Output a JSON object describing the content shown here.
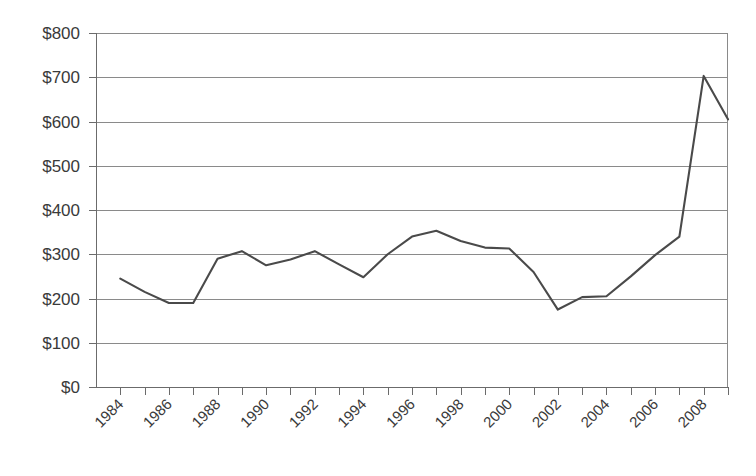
{
  "chart_data": {
    "type": "line",
    "title": "",
    "subtitle": "",
    "xlabel": "",
    "ylabel": "",
    "grid": true,
    "legend": false,
    "legend_position": "none",
    "line_color": "#4a4a4a",
    "axis_color": "#6b6b6b",
    "grid_color": "#8a8a8a",
    "background_color": "#ffffff",
    "ylim": [
      0,
      800
    ],
    "ytick_step": 100,
    "ytick_labels": [
      "$0",
      "$100",
      "$200",
      "$300",
      "$400",
      "$500",
      "$600",
      "$700",
      "$800"
    ],
    "ytick_values": [
      0,
      100,
      200,
      300,
      400,
      500,
      600,
      700,
      800
    ],
    "xlim": [
      1983,
      2009
    ],
    "xtick_label_step": 2,
    "xtick_labels": [
      "1984",
      "1986",
      "1988",
      "1990",
      "1992",
      "1994",
      "1996",
      "1998",
      "2000",
      "2002",
      "2004",
      "2006",
      "2008"
    ],
    "xtick_label_values": [
      1984,
      1986,
      1988,
      1990,
      1992,
      1994,
      1996,
      1998,
      2000,
      2002,
      2004,
      2006,
      2008
    ],
    "xtick_label_rotation": -45,
    "x": [
      1984,
      1985,
      1986,
      1987,
      1988,
      1989,
      1990,
      1991,
      1992,
      1993,
      1994,
      1995,
      1996,
      1997,
      1998,
      1999,
      2000,
      2001,
      2002,
      2003,
      2004,
      2005,
      2006,
      2007,
      2008,
      2009
    ],
    "series": [
      {
        "name": "Value",
        "values": [
          245,
          215,
          190,
          190,
          290,
          307,
          275,
          288,
          307,
          277,
          248,
          300,
          340,
          353,
          330,
          315,
          313,
          260,
          175,
          203,
          205,
          250,
          298,
          340,
          703,
          605
        ]
      }
    ],
    "annotations": []
  }
}
